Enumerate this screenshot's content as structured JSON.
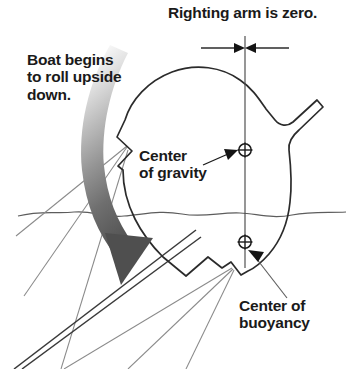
{
  "diagram": {
    "title_note": "Righting arm is zero.",
    "roll_note": "Boat begins\nto roll upside\ndown.",
    "center_of_gravity_label": "Center\nof gravity",
    "center_of_buoyancy_label": "Center of\nbuoyancy",
    "colors": {
      "outline": "#2b2b2b",
      "thin_line": "#6d6d6d",
      "text": "#1a1a1a",
      "arrow_dark": "#4d4d4d",
      "arrow_light": "#f2f2f2",
      "background": "#ffffff"
    },
    "markers": {
      "center_of_gravity_symbol": "circled-plus",
      "center_of_buoyancy_symbol": "circled-plus"
    },
    "dimension": {
      "value_text": "zero",
      "style": "double-arrowhead-inward"
    }
  }
}
